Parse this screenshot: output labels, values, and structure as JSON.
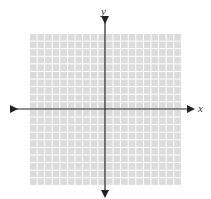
{
  "diagram": {
    "type": "coordinate-plane",
    "x_axis_label": "x",
    "y_axis_label": "y",
    "grid": {
      "columns": 20,
      "rows": 20,
      "fill_color": "#dcdcdc",
      "line_color": "#ffffff"
    },
    "axis_color": "#222222"
  }
}
